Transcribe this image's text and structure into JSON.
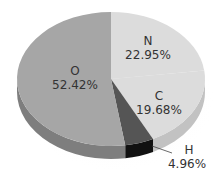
{
  "chart_data": {
    "type": "pie",
    "title": "",
    "style": "3d",
    "slices": [
      {
        "label": "O",
        "value": 52.42,
        "display": "52.42%",
        "color": "#a6a6a6",
        "side_color": "#7e7e7e"
      },
      {
        "label": "N",
        "value": 22.95,
        "display": "22.95%",
        "color": "#dcdcdc",
        "side_color": "#c2c2c2"
      },
      {
        "label": "C",
        "value": 19.68,
        "display": "19.68%",
        "color": "#dcdcdc",
        "side_color": "#c2c2c2"
      },
      {
        "label": "H",
        "value": 4.96,
        "display": "4.96%",
        "color": "#555555",
        "side_color": "#111111"
      }
    ]
  },
  "labels": {
    "o_name": "O",
    "o_value": "52.42%",
    "n_name": "N",
    "n_value": "22.95%",
    "c_name": "C",
    "c_value": "19.68%",
    "h_name": "H",
    "h_value": "4.96%"
  }
}
